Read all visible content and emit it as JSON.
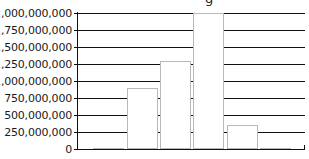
{
  "chart_data": {
    "type": "bar",
    "xlabel": "",
    "ylabel": "",
    "categories": [
      "1",
      "2",
      "3",
      "4",
      "5",
      "6"
    ],
    "values": [
      15000000,
      890000000,
      1300000000,
      2000000000,
      350000000,
      15000000
    ],
    "ylim": [
      0,
      2000000000
    ],
    "yticks": [
      0,
      250000000,
      500000000,
      750000000,
      1000000000,
      1250000000,
      1500000000,
      1750000000,
      2000000000
    ],
    "ytick_labels": [
      "0",
      "250,000,000",
      "500,000,000",
      "750,000,000",
      "1,000,000,000",
      "1,250,000,000",
      "1,500,000,000",
      "1,750,000,000",
      "2,000,000,000"
    ],
    "grid": true,
    "legend": null,
    "colors": {
      "bar_fill": "#ffffff",
      "bar_edge": "#b8b8b8",
      "grid": "#111111",
      "axis": "#111111"
    }
  },
  "title_fragment": "g"
}
